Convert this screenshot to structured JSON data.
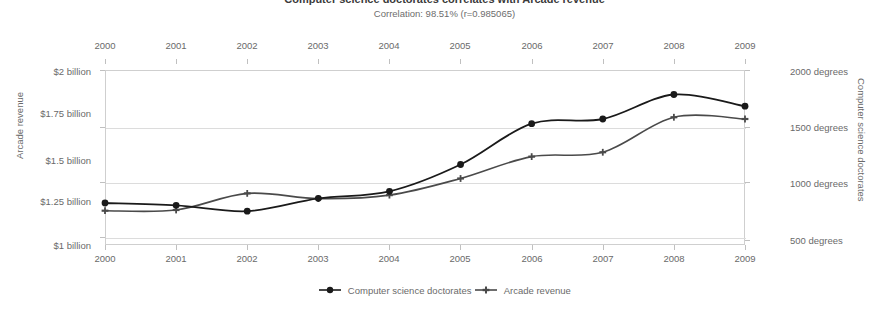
{
  "chart_data": {
    "type": "line",
    "title": "Computer science doctorates correlates with Arcade revenue",
    "subtitle": "Correlation: 98.51% (r=0.985065)",
    "categories": [
      "2000",
      "2001",
      "2002",
      "2003",
      "2004",
      "2005",
      "2006",
      "2007",
      "2008",
      "2009"
    ],
    "x": [
      2000,
      2001,
      2002,
      2003,
      2004,
      2005,
      2006,
      2007,
      2008,
      2009
    ],
    "grid": true,
    "legend_position": "bottom",
    "axes": {
      "x_top": {
        "ticks": [
          "2000",
          "2001",
          "2002",
          "2003",
          "2004",
          "2005",
          "2006",
          "2007",
          "2008",
          "2009"
        ]
      },
      "x_bottom": {
        "ticks": [
          "2000",
          "2001",
          "2002",
          "2003",
          "2004",
          "2005",
          "2006",
          "2007",
          "2008",
          "2009"
        ]
      },
      "y_left": {
        "label": "Arcade revenue",
        "ticks": [
          "$2 billion",
          "$1.75 billion",
          "$1.5 billion",
          "$1.25 billion",
          "$1 billion"
        ],
        "tick_values": [
          2.0,
          1.75,
          1.5,
          1.25,
          1.0
        ],
        "ylim": [
          1.0,
          2.0
        ],
        "unit": "billion USD"
      },
      "y_right": {
        "label": "Computer science doctorates",
        "ticks": [
          "2000 degrees",
          "1500 degrees",
          "1000 degrees",
          "500 degrees"
        ],
        "tick_values": [
          2000,
          1500,
          1000,
          500
        ],
        "ylim": [
          500,
          2000
        ],
        "unit": "degrees"
      }
    },
    "series": [
      {
        "name": "Computer science doctorates",
        "axis": "right",
        "marker": "circle",
        "color": "#1a1a1a",
        "unit": "degrees",
        "values": [
          860,
          840,
          790,
          900,
          960,
          1190,
          1540,
          1580,
          1790,
          1690
        ]
      },
      {
        "name": "Arcade revenue",
        "axis": "left",
        "marker": "plus",
        "color": "#4a4a4a",
        "unit": "billion USD",
        "values": [
          1.196,
          1.2,
          1.295,
          1.265,
          1.285,
          1.38,
          1.505,
          1.53,
          1.73,
          1.72
        ]
      }
    ]
  },
  "legend": {
    "items": [
      {
        "label": "Computer science doctorates",
        "marker": "circle-marker"
      },
      {
        "label": "Arcade revenue",
        "marker": "plus-marker"
      }
    ]
  }
}
